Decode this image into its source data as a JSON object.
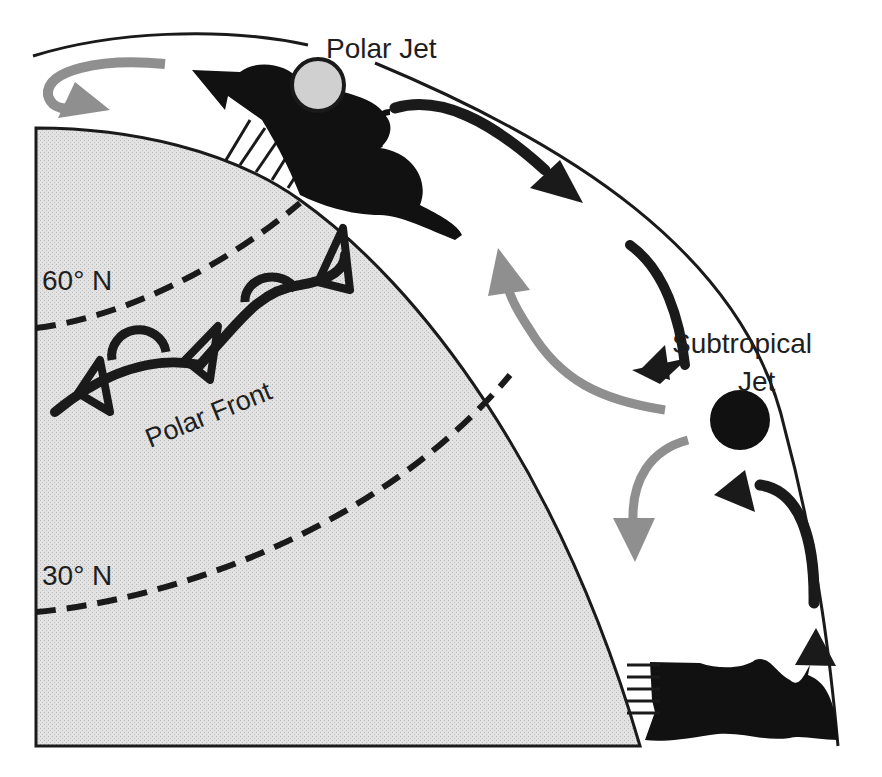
{
  "diagram": {
    "type": "atmospheric-circulation-cross-section",
    "labels": {
      "polar_jet": "Polar Jet",
      "subtropical_jet_line1": "Subtropical",
      "subtropical_jet_line2": "Jet",
      "lat_60": "60° N",
      "lat_30": "30° N",
      "polar_front": "Polar Front"
    },
    "colors": {
      "earth_fill": "#dcdcdc",
      "ink": "#1a1a1a",
      "gray_arrow": "#8f8f8f",
      "polar_jet_fill": "#d0d0d0",
      "subtropical_jet_fill": "#111111",
      "background": "#ffffff"
    }
  }
}
